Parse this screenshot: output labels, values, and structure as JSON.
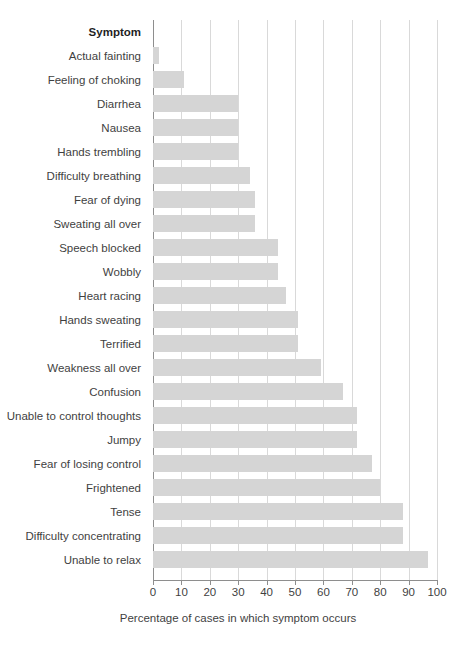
{
  "chart_data": {
    "type": "bar",
    "orientation": "horizontal",
    "title": "",
    "xlabel": "Percentage of cases in which symptom occurs",
    "ylabel": "Symptom",
    "xlim": [
      0,
      100
    ],
    "xticks": [
      0,
      10,
      20,
      30,
      40,
      50,
      60,
      70,
      80,
      90,
      100
    ],
    "xtick_labels": [
      "0",
      "10",
      "20",
      "30",
      "40",
      "50",
      "60",
      "70",
      "80",
      "90",
      "100"
    ],
    "grid": true,
    "legend": "none",
    "bar_color": "#d5d5d5",
    "axis_color": "#8e8e8e",
    "gridline_color": "#d9d9d9",
    "text_color": "#3f3f3f",
    "categories": [
      "Actual fainting",
      "Feeling of choking",
      "Diarrhea",
      "Nausea",
      "Hands trembling",
      "Difficulty breathing",
      "Fear of dying",
      "Sweating all over",
      "Speech blocked",
      "Wobbly",
      "Heart racing",
      "Hands sweating",
      "Terrified",
      "Weakness all over",
      "Confusion",
      "Unable to control thoughts",
      "Jumpy",
      "Fear of losing control",
      "Frightened",
      "Tense",
      "Difficulty concentrating",
      "Unable to relax"
    ],
    "values": [
      2,
      11,
      30,
      30,
      30,
      34,
      36,
      36,
      44,
      44,
      47,
      51,
      51,
      59,
      67,
      72,
      72,
      77,
      80,
      88,
      88,
      97
    ]
  },
  "axis": {
    "y_header": "Symptom",
    "x_title": "Percentage of cases in which symptom occurs"
  }
}
